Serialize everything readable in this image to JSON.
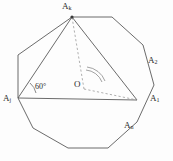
{
  "figure": {
    "stroke_color": "#5a5a5a",
    "dashed_color": "#9a9a9a",
    "background": "#fdfdfd",
    "text_color": "#2a2a2a"
  },
  "labels": {
    "top_vertex": "A",
    "top_vertex_sub": "k",
    "upper_right_vertex": "A",
    "upper_right_vertex_sub": "2",
    "right_vertex": "A",
    "right_vertex_sub": "1",
    "lower_right_vertex": "A",
    "lower_right_vertex_sub": "n",
    "left_vertex": "A",
    "left_vertex_sub": "j",
    "center": "O",
    "angle": "60°"
  },
  "geometry": {
    "polygon_sides": 10,
    "polygon_points": "72,17 112,17 143,45 154,85 137,122 108,148 68,148 33,128 18,98 18,55",
    "triangle_points": "72,17 137,100 18,98",
    "center_point": {
      "x": 84,
      "y": 89
    },
    "dashed_lines": [
      {
        "x1": 84,
        "y1": 89,
        "x2": 72,
        "y2": 17
      },
      {
        "x1": 84,
        "y1": 89,
        "x2": 137,
        "y2": 100
      }
    ],
    "angle_arc_path": "M 102,82 A 19,19 0 0 0 86,70",
    "angle_arc_path_outer": "M 105,81 A 22,22 0 0 0 87,67",
    "angle_mark_60_path": "M 36,93 A 18,18 0 0 0 30,83",
    "baseline": {
      "x1": 18,
      "y1": 98,
      "x2": 137,
      "y2": 100
    },
    "vertex_dot": {
      "x": 72,
      "y": 17,
      "r": 1.6
    }
  }
}
